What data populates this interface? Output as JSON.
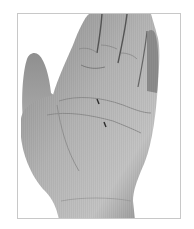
{
  "image": {
    "subject": "open palm of a hand, grayscale photograph",
    "alt": "Grayscale photo of an open left palm with two small marks in the center",
    "frame_color": "#c8c8c8",
    "background": "#ffffff",
    "skin_tones": {
      "light": "#bdbdbd",
      "mid": "#9a9a9a",
      "dark": "#5e5e5e",
      "crease": "#4a4a4a"
    },
    "marks": [
      {
        "label": "mark-upper",
        "x": 97,
        "y": 100
      },
      {
        "label": "mark-lower",
        "x": 104,
        "y": 123
      }
    ]
  }
}
